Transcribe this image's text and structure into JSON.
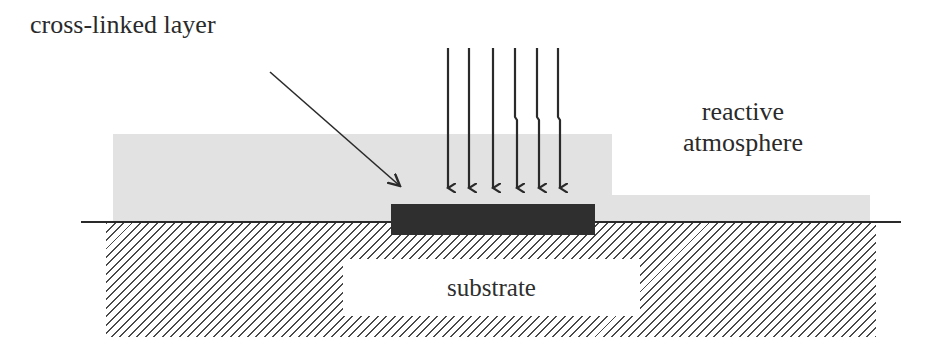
{
  "diagram": {
    "type": "schematic cross-section",
    "labels": {
      "crosslinked_layer": "cross-linked layer",
      "atmosphere_line1": "reactive",
      "atmosphere_line2": "atmosphere",
      "substrate": "substrate"
    },
    "elements": {
      "incident_arrows_count": 6,
      "regions": [
        "reactive atmosphere (gray)",
        "cross-linked layer (dark)",
        "substrate (hatched)"
      ]
    },
    "colors": {
      "atmosphere": "#e2e2e2",
      "crosslinked_layer": "#2f2f2f",
      "hatch": "#4a4a4a",
      "lines": "#2a2a2a",
      "background": "#ffffff"
    }
  }
}
